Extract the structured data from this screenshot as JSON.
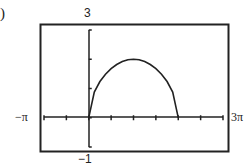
{
  "part_label": ")",
  "chart_data": {
    "type": "line",
    "title": "",
    "xlabel": "",
    "ylabel": "",
    "xlim_labels": [
      "−π",
      "3π"
    ],
    "ylim_labels": [
      "−1",
      "3"
    ],
    "xlim": [
      -3.14159,
      9.42478
    ],
    "ylim": [
      -1,
      3
    ],
    "x_tick_step": "π/2",
    "y_tick_step": 1,
    "grid": false,
    "series": [
      {
        "name": "y = 2√(sin(x/2))",
        "x": [
          0,
          0.3927,
          0.7854,
          1.1781,
          1.5708,
          1.9635,
          2.3562,
          2.7489,
          3.1416,
          3.5343,
          3.927,
          4.3197,
          4.7124,
          5.1051,
          5.4978,
          5.8905,
          6.2832
        ],
        "values": [
          0,
          0.88,
          1.24,
          1.49,
          1.68,
          1.82,
          1.92,
          1.98,
          2.0,
          1.98,
          1.92,
          1.82,
          1.68,
          1.49,
          1.24,
          0.88,
          0
        ]
      }
    ]
  }
}
